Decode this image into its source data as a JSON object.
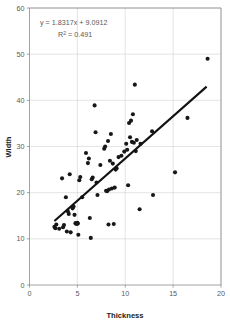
{
  "chart_data": {
    "type": "scatter",
    "title": "",
    "xlabel": "Thickness",
    "ylabel": "Width",
    "xlim": [
      0,
      20
    ],
    "ylim": [
      0,
      60
    ],
    "xticks": [
      0,
      5,
      10,
      15,
      20
    ],
    "yticks": [
      0,
      10,
      20,
      30,
      40,
      50,
      60
    ],
    "grid": true,
    "legend": null,
    "annotations": {
      "equation": "y = 1.8317x + 9.0912",
      "r_squared_label": "R",
      "r_squared_exponent": "2",
      "r_squared_value": " = 0.491"
    },
    "trendline": {
      "type": "linear",
      "slope": 1.8317,
      "intercept": 9.0912,
      "r_squared": 0.491,
      "x_start": 2.6,
      "x_end": 18.5
    },
    "series": [
      {
        "name": "Thickness vs Width",
        "marker": "filled-circle",
        "color": "#171717",
        "points": [
          [
            2.6,
            12.6
          ],
          [
            2.7,
            12.3
          ],
          [
            2.8,
            13.1
          ],
          [
            3.1,
            12.2
          ],
          [
            3.4,
            23.1
          ],
          [
            3.5,
            12.5
          ],
          [
            3.6,
            13.0
          ],
          [
            3.8,
            19.0
          ],
          [
            3.9,
            11.6
          ],
          [
            4.0,
            16.0
          ],
          [
            4.1,
            15.4
          ],
          [
            4.2,
            24.0
          ],
          [
            4.3,
            11.4
          ],
          [
            4.5,
            16.6
          ],
          [
            4.6,
            17.0
          ],
          [
            4.7,
            15.2
          ],
          [
            4.8,
            13.4
          ],
          [
            4.9,
            13.2
          ],
          [
            5.0,
            13.5
          ],
          [
            5.05,
            13.3
          ],
          [
            5.1,
            10.9
          ],
          [
            5.2,
            22.7
          ],
          [
            5.3,
            23.4
          ],
          [
            5.5,
            19.0
          ],
          [
            5.9,
            28.6
          ],
          [
            6.1,
            26.4
          ],
          [
            6.2,
            27.4
          ],
          [
            6.3,
            14.5
          ],
          [
            6.4,
            10.2
          ],
          [
            6.5,
            22.9
          ],
          [
            6.6,
            23.3
          ],
          [
            6.8,
            38.9
          ],
          [
            6.9,
            33.1
          ],
          [
            7.0,
            22.2
          ],
          [
            7.1,
            19.5
          ],
          [
            7.4,
            26.0
          ],
          [
            7.8,
            29.5
          ],
          [
            7.9,
            30.0
          ],
          [
            8.0,
            20.4
          ],
          [
            8.1,
            20.3
          ],
          [
            8.2,
            31.2
          ],
          [
            8.25,
            13.1
          ],
          [
            8.3,
            20.7
          ],
          [
            8.4,
            26.9
          ],
          [
            8.5,
            32.7
          ],
          [
            8.6,
            20.9
          ],
          [
            8.7,
            26.3
          ],
          [
            8.8,
            13.2
          ],
          [
            8.9,
            21.1
          ],
          [
            9.0,
            25.0
          ],
          [
            9.1,
            25.3
          ],
          [
            9.3,
            27.7
          ],
          [
            9.6,
            28.0
          ],
          [
            9.9,
            28.9
          ],
          [
            10.1,
            30.6
          ],
          [
            10.2,
            29.3
          ],
          [
            10.3,
            21.6
          ],
          [
            10.4,
            35.1
          ],
          [
            10.5,
            32.0
          ],
          [
            10.6,
            35.6
          ],
          [
            10.7,
            31.0
          ],
          [
            10.8,
            37.0
          ],
          [
            10.9,
            30.8
          ],
          [
            11.0,
            43.4
          ],
          [
            11.1,
            29.0
          ],
          [
            11.2,
            31.4
          ],
          [
            11.5,
            16.4
          ],
          [
            11.6,
            30.6
          ],
          [
            12.8,
            33.3
          ],
          [
            12.9,
            19.5
          ],
          [
            15.2,
            24.4
          ],
          [
            16.5,
            36.2
          ],
          [
            18.6,
            49.0
          ]
        ]
      }
    ]
  },
  "colors": {
    "marker": "#171717",
    "trendline": "#111111",
    "grid": "#d2d2d4",
    "frame": "#8b8b8d",
    "tick_text": "#58585a",
    "axis_title": "#1b1b1b"
  }
}
